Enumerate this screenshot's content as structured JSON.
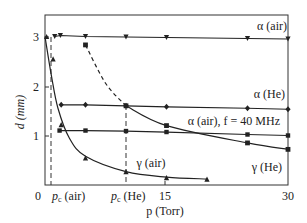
{
  "chart_data": {
    "type": "line",
    "title": "",
    "xlabel": "p (Torr)",
    "ylabel": "d (mm)",
    "xlim": [
      0,
      30
    ],
    "ylim": [
      0,
      3.3
    ],
    "grid": false,
    "x_ticks": [
      {
        "value": 0,
        "label": "0"
      },
      {
        "value": 1,
        "label": "p_c (air)"
      },
      {
        "value": 10,
        "label": "p_c (He)"
      },
      {
        "value": 15,
        "label": "15"
      },
      {
        "value": 30,
        "label": "30"
      }
    ],
    "y_ticks": [
      {
        "value": 1,
        "label": "1"
      },
      {
        "value": 2,
        "label": "2"
      },
      {
        "value": 3,
        "label": "3"
      }
    ],
    "vertical_dashed_lines": [
      {
        "x": 1.0,
        "label": "p_c (air)"
      },
      {
        "x": 10.0,
        "label": "p_c (He)"
      }
    ],
    "series": [
      {
        "name": "α (air)",
        "marker": "triangle-down",
        "style": "solid",
        "x": [
          1.2,
          1.9,
          5.0,
          10.0,
          15.0,
          25.0,
          30.0
        ],
        "y": [
          3.0,
          3.02,
          3.0,
          2.99,
          2.98,
          2.96,
          2.95
        ]
      },
      {
        "name": "α (He)",
        "marker": "diamond",
        "style": "solid",
        "x": [
          2.0,
          5.0,
          10.0,
          15.0,
          25.0,
          30.0
        ],
        "y": [
          1.62,
          1.62,
          1.6,
          1.58,
          1.55,
          1.53
        ]
      },
      {
        "name": "α (air), f = 40 MHz",
        "marker": "dot",
        "style": "solid",
        "x": [
          1.8,
          5.0,
          10.0,
          15.0,
          25.0,
          30.0
        ],
        "y": [
          1.1,
          1.1,
          1.09,
          1.07,
          1.02,
          1.0
        ]
      },
      {
        "name": "γ (He)",
        "marker": "square",
        "style": "dashed-then-solid",
        "x": [
          5.0,
          10.0,
          15.0,
          25.0,
          30.0
        ],
        "y": [
          2.83,
          1.6,
          1.2,
          0.85,
          0.72
        ]
      },
      {
        "name": "γ (air)",
        "marker": "triangle-up",
        "style": "solid",
        "x": [
          0.2,
          1.0,
          2.0,
          5.0,
          10.0,
          15.0,
          20.0
        ],
        "y": [
          3.0,
          2.55,
          1.22,
          0.55,
          0.27,
          0.15,
          0.12
        ]
      }
    ],
    "annotations": [
      {
        "text": "α (air)",
        "near": "right, above α(air) line"
      },
      {
        "text": "α (He)",
        "near": "right, above α(He) line"
      },
      {
        "text": "α (air), f = 40 MHz",
        "near": "right, above 40 MHz line"
      },
      {
        "text": "γ (He)",
        "near": "right, below γ(He) curve"
      },
      {
        "text": "γ (air)",
        "near": "center, above γ(air) curve"
      }
    ]
  },
  "labels": {
    "y_axis": "d (mm)",
    "x_axis": "p (Torr)",
    "x0": "0",
    "x15": "15",
    "x30": "30",
    "pc_air": "p",
    "pc_air_sub": "c",
    "pc_air_tail": " (air)",
    "pc_he": "p",
    "pc_he_sub": "c",
    "pc_he_tail": " (He)",
    "y1": "1",
    "y2": "2",
    "y3": "3",
    "alpha_air": "α (air)",
    "alpha_he": "α (He)",
    "alpha_air_40": "α (air), f = 40 MHz",
    "gamma_he": "γ (He)",
    "gamma_air": "γ (air)"
  }
}
